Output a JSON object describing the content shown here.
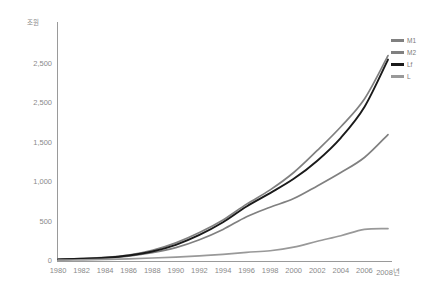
{
  "chart_data": {
    "type": "line",
    "title": "",
    "ylabel": "조원",
    "xlabel": "",
    "unit_caption": "조원",
    "x_axis_suffix": "년",
    "grid": false,
    "legend_position": "top-right",
    "xlim": [
      1980,
      2008
    ],
    "ylim": [
      0,
      3000
    ],
    "y_ticks": [
      "0",
      "500",
      "1,000",
      "1,500",
      "2,500",
      "2,500"
    ],
    "y_tick_values": [
      0,
      500,
      1000,
      1500,
      2000,
      2500
    ],
    "categories": [
      1980,
      1982,
      1984,
      1986,
      1988,
      1990,
      1992,
      1994,
      1996,
      1998,
      2000,
      2002,
      2004,
      2006,
      2008
    ],
    "x_tick_labels": [
      "1980",
      "1982",
      "1984",
      "1986",
      "1988",
      "1990",
      "1992",
      "1994",
      "1996",
      "1998",
      "2000",
      "2002",
      "2004",
      "2006",
      "2008년"
    ],
    "series": [
      {
        "name": "M1",
        "color": "#808080",
        "values": [
          20,
          30,
          45,
          75,
          135,
          230,
          360,
          520,
          720,
          900,
          1120,
          1400,
          1700,
          2050,
          2600
        ]
      },
      {
        "name": "M2",
        "color": "#808080",
        "values": [
          18,
          26,
          38,
          62,
          105,
          170,
          270,
          400,
          560,
          680,
          790,
          950,
          1120,
          1310,
          1600
        ]
      },
      {
        "name": "Lf",
        "color": "#1a1a1a",
        "values": [
          20,
          28,
          42,
          70,
          120,
          205,
          330,
          490,
          690,
          860,
          1040,
          1270,
          1560,
          1950,
          2550
        ]
      },
      {
        "name": "L",
        "color": "#999999",
        "values": [
          10,
          14,
          20,
          28,
          38,
          50,
          65,
          85,
          110,
          130,
          175,
          250,
          320,
          400,
          410
        ]
      }
    ]
  },
  "axis": {
    "y_unit": "조원"
  },
  "legend": {
    "items": [
      {
        "label": "M1",
        "color": "#808080"
      },
      {
        "label": "M2",
        "color": "#808080"
      },
      {
        "label": "Lf",
        "color": "#1a1a1a"
      },
      {
        "label": "L",
        "color": "#999999"
      }
    ]
  }
}
